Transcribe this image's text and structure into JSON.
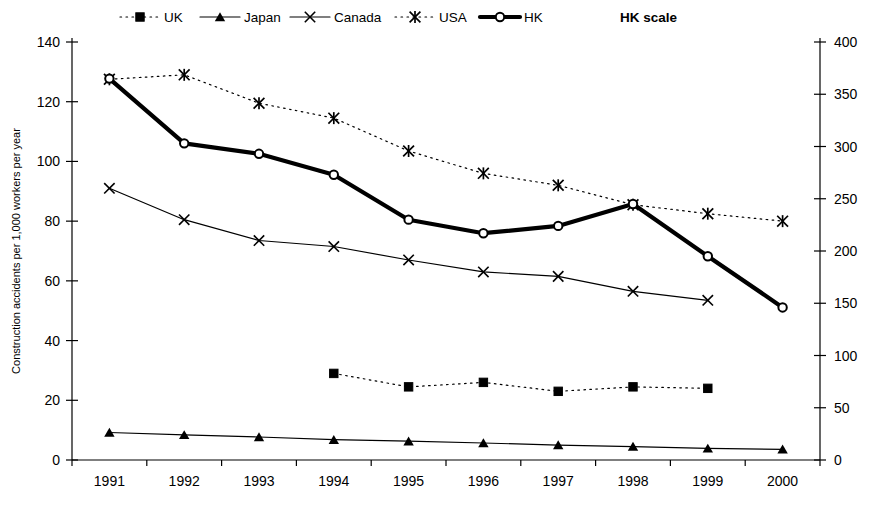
{
  "chart_data": {
    "type": "line",
    "title": "",
    "xlabel": "",
    "ylabel": "Construction accidents per 1,000 workers per year",
    "y2label": "HK scale",
    "categories": [
      "1991",
      "1992",
      "1993",
      "1994",
      "1995",
      "1996",
      "1997",
      "1998",
      "1999",
      "2000"
    ],
    "ylim": [
      0,
      140
    ],
    "yticks": [
      0,
      20,
      40,
      60,
      80,
      100,
      120,
      140
    ],
    "y2lim": [
      0,
      400
    ],
    "y2ticks": [
      0,
      50,
      100,
      150,
      200,
      250,
      300,
      350,
      400
    ],
    "grid": false,
    "legend_position": "top",
    "series": [
      {
        "name": "UK",
        "axis": "left",
        "marker": "square",
        "line_style": "dotted",
        "line_width": 1.2,
        "color": "#000000",
        "values": [
          null,
          null,
          null,
          29,
          24.5,
          26,
          23,
          24.5,
          24,
          null
        ]
      },
      {
        "name": "Japan",
        "axis": "left",
        "marker": "triangle",
        "line_style": "solid",
        "line_width": 1.2,
        "color": "#000000",
        "values": [
          9.2,
          8.4,
          7.7,
          6.8,
          6.3,
          5.7,
          5.0,
          4.5,
          3.9,
          3.6
        ]
      },
      {
        "name": "Canada",
        "axis": "left",
        "marker": "cross",
        "line_style": "solid",
        "line_width": 1.2,
        "color": "#000000",
        "values": [
          91,
          80.5,
          73.5,
          71.5,
          67,
          63,
          61.5,
          56.5,
          53.5,
          null
        ]
      },
      {
        "name": "USA",
        "axis": "left",
        "marker": "asterisk",
        "line_style": "dotted",
        "line_width": 1.2,
        "color": "#000000",
        "values": [
          127.5,
          129,
          119.5,
          114.5,
          103.5,
          96,
          92,
          85.5,
          82.5,
          80
        ]
      },
      {
        "name": "HK",
        "axis": "right",
        "marker": "circle",
        "line_style": "solid",
        "line_width": 4.2,
        "color": "#000000",
        "values": [
          365,
          303,
          293,
          273,
          230,
          217,
          224,
          245,
          195,
          146
        ]
      }
    ],
    "legend": [
      {
        "label": "UK",
        "marker": "square",
        "line_style": "dotted",
        "line_width": 1.2
      },
      {
        "label": "Japan",
        "marker": "triangle",
        "line_style": "solid",
        "line_width": 1.2
      },
      {
        "label": "Canada",
        "marker": "cross",
        "line_style": "solid",
        "line_width": 1.2
      },
      {
        "label": "USA",
        "marker": "asterisk",
        "line_style": "dotted",
        "line_width": 1.2
      },
      {
        "label": "HK",
        "marker": "circle",
        "line_style": "solid",
        "line_width": 4.2
      }
    ],
    "legend_extra": "HK scale"
  }
}
